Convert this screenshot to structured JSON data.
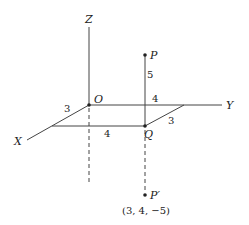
{
  "diagram": {
    "type": "3d-coordinate-axes",
    "axes": {
      "x_label": "X",
      "y_label": "Y",
      "z_label": "Z"
    },
    "origin": {
      "label": "O"
    },
    "points": {
      "P": {
        "label": "P"
      },
      "Q": {
        "label": "Q"
      },
      "P_prime": {
        "label": "P′",
        "coords": "(3, 4, −5)"
      }
    },
    "measurements": {
      "ox_segment": "3",
      "oy_segment": "4",
      "bottom_edge": "4",
      "right_edge": "3",
      "pq_height": "5"
    },
    "colors": {
      "line": "#444444",
      "text": "#222222",
      "background": "#ffffff"
    }
  }
}
